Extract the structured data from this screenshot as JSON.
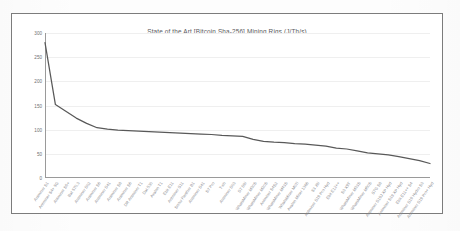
{
  "chart_data": {
    "type": "line",
    "title": "State of the Art [Bitcoin Sha-256] Mining Rigs (J/Th/s)",
    "xlabel": "",
    "ylabel": "",
    "ylim": [
      0,
      300
    ],
    "yticks": [
      0,
      50,
      100,
      150,
      200,
      250,
      300
    ],
    "ytick_labels": [
      "0",
      "50",
      "100",
      "150",
      "200",
      "250",
      "300"
    ],
    "grid": true,
    "legend": false,
    "line_color": "#595959",
    "categories": [
      "Antminer S1",
      "Antminer S4+ 5G",
      "Antminer S5+",
      "Bat 570.3",
      "Antminer S02",
      "Antminer S6",
      "Antminer S41",
      "Antminer S8",
      "Antminer S6",
      "DR Antminer T1",
      "Dat 530",
      "Avalon T1",
      "Ebit E11",
      "Antminer S11",
      "Snow Panther B1",
      "Antminer S41",
      "S7 Pro",
      "T-sh",
      "Antminer S03",
      "S7 S9i",
      "WhatsMiner M30S",
      "WhatsMiner M20S",
      "Antminer S4S2",
      "WhatsMiner M43S",
      "WhatsMiner M07i",
      "Avalon Miner 1366",
      "S3 J9i",
      "Antminer S19 Pro Hyd",
      "Ebit E12++",
      "S3 X9T",
      "WhatsMiner M33S",
      "WhatsMiner M50S",
      "S7G S8",
      "Antminer S19J XP Hyd",
      "Antminer S19 XP Hyd",
      "Ebit E11++ S4",
      "Antminer S19 Hydro S3",
      "Antminer S19 Pro+ Hyd"
    ],
    "values": [
      280,
      152,
      138,
      124,
      113,
      104,
      101,
      99,
      98,
      97,
      96,
      95,
      94,
      93,
      92,
      91,
      90,
      88,
      87,
      86,
      80,
      76,
      74,
      73,
      71,
      70,
      68,
      66,
      62,
      60,
      56,
      52,
      50,
      48,
      44,
      40,
      36,
      30
    ]
  }
}
